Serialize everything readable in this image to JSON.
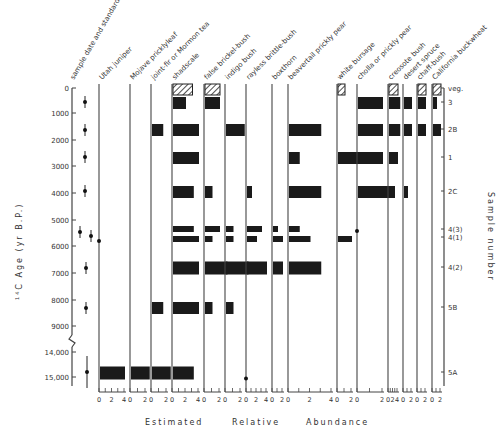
{
  "chart_data": {
    "type": "bar",
    "subtype": "pollen/macrofossil abundance diagram (horizontal bars per taxon vs. age)",
    "title": "",
    "xlabel": "Estimated Relative Abundance",
    "ylabel": "14C Age (yr B.P.)",
    "right_axis_label": "Sample number",
    "y_ticks": [
      "0",
      "1000",
      "2000",
      "3000",
      "4000",
      "5000",
      "6000",
      "7000",
      "8000",
      "9000",
      "14,000",
      "15,000"
    ],
    "y_axis_break": "between 9000 and 14,000",
    "first_column_label": "sample date and standard deviation",
    "samples": [
      {
        "id": "veg.",
        "age": 0,
        "modern": true
      },
      {
        "id": "3",
        "age": 500,
        "sd": 100
      },
      {
        "id": "2B",
        "age": 1550,
        "sd": 120
      },
      {
        "id": "1",
        "age": 2650,
        "sd": 100
      },
      {
        "id": "2C",
        "age": 3900,
        "sd": 150
      },
      {
        "id": "4(3)",
        "age": 5450,
        "sd": 150
      },
      {
        "id": "4(1)",
        "age": 5600,
        "sd": 150
      },
      {
        "id": "4(2)",
        "age": 6800,
        "sd": 150
      },
      {
        "id": "5B",
        "age": 8300,
        "sd": 200
      },
      {
        "id": "5A",
        "age": 14700,
        "sd": 400
      }
    ],
    "taxa": [
      {
        "name": "Utah juniper",
        "scale": [
          0,
          2,
          4
        ],
        "values": {
          "4(1)": "trace",
          "5A": 4
        }
      },
      {
        "name": "Mojave pricklyleaf",
        "scale": [
          0,
          2
        ],
        "values": {
          "5A": 2.5
        }
      },
      {
        "name": "joint-fir or Mormon tea",
        "scale": [
          0,
          2
        ],
        "values": {
          "2B": 1.5,
          "5B": 1.5,
          "5A": 2.5
        }
      },
      {
        "name": "shadscale",
        "scale": [
          0,
          2,
          4
        ],
        "values": {
          "veg.": 3,
          "3": 2,
          "2B": 4,
          "1": 4,
          "2C": 3.2,
          "4(3)": 3.2,
          "4(1)": 4,
          "4(2)": 4,
          "5B": 4,
          "5A": 3.2
        }
      },
      {
        "name": "false brickel-bush",
        "scale": [
          0,
          2
        ],
        "values": {
          "veg.": 2,
          "3": 2,
          "2C": 1,
          "4(3)": 2,
          "4(1)": 1,
          "4(2)": 3,
          "5B": 1
        }
      },
      {
        "name": "indigo bush",
        "scale": [
          0,
          2
        ],
        "values": {
          "2B": 2.5,
          "4(3)": 1,
          "4(1)": 1,
          "4(2)": 3,
          "5B": 1
        }
      },
      {
        "name": "rayless brittle-bush",
        "scale": [
          0,
          2,
          4
        ],
        "values": {
          "2C": 1,
          "4(3)": 3,
          "4(1)": 2,
          "4(2)": 4,
          "5A": "trace"
        }
      },
      {
        "name": "boxthorn",
        "scale": [
          0,
          2
        ],
        "values": {
          "4(3)": 1,
          "4(1)": 2,
          "4(2)": 2
        }
      },
      {
        "name": "beavertail prickly pear",
        "scale": [
          0,
          2,
          4
        ],
        "values": {
          "2B": 3,
          "1": 1,
          "2C": 3,
          "4(3)": 1,
          "4(1)": 2,
          "4(2)": 3
        }
      },
      {
        "name": "white bursage",
        "scale": [
          0,
          2
        ],
        "values": {
          "veg.": 1,
          "1": 3,
          "4(1)": 2
        }
      },
      {
        "name": "cholla or prickly pear",
        "scale": [
          0,
          2
        ],
        "values": {
          "3": 2,
          "2B": 2,
          "1": 2,
          "2C": 3,
          "4(3)": "trace"
        }
      },
      {
        "name": "creosote bush",
        "scale": [
          0,
          2,
          4
        ],
        "values": {
          "veg.": 4,
          "3": 5,
          "2B": 5,
          "1": 4,
          "2C": 2
        }
      },
      {
        "name": "desert spruce",
        "scale": [
          0,
          2
        ],
        "values": {
          "3": 2,
          "2B": 2,
          "2C": 1
        }
      },
      {
        "name": "chaff-bush",
        "scale": [
          0,
          2
        ],
        "values": {
          "veg.": 2,
          "3": 2,
          "2B": 2
        }
      },
      {
        "name": "California buckwheat",
        "scale": [
          0,
          2
        ],
        "values": {
          "veg.": 2,
          "3": 1,
          "2B": 2
        }
      }
    ],
    "legend": "hatched bars = modern vegetation (veg.); solid bars = packrat midden samples",
    "grid": false
  },
  "labels": {
    "ylabel": "14C Age (yr B.P.)",
    "ylabel_sup": "14",
    "ylabel_main": "C Age (yr B.P.)",
    "right_label": "Sample number",
    "xlabel_1": "Estimated",
    "xlabel_2": "Relative",
    "xlabel_3": "Abundance"
  },
  "colors": {
    "bar": "#1a1a1a",
    "axis": "#444444",
    "text": "#333333"
  }
}
